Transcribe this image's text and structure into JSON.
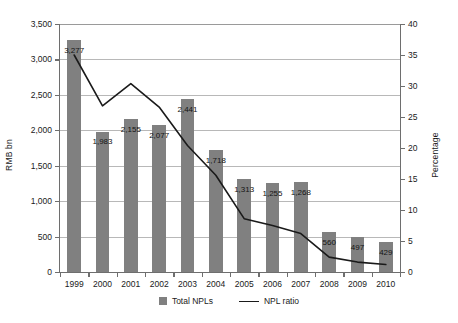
{
  "chart_data": {
    "type": "bar",
    "title": "",
    "subtitle": "",
    "xlabel": "",
    "ylabel": "RMB bn",
    "ylabel_secondary": "Percentage",
    "categories": [
      "1999",
      "2000",
      "2001",
      "2002",
      "2003",
      "2004",
      "2005",
      "2006",
      "2007",
      "2008",
      "2009",
      "2010"
    ],
    "ylim": [
      0,
      3500
    ],
    "ylim_secondary": [
      0,
      40
    ],
    "yticks": [
      "0",
      "500",
      "1,000",
      "1,500",
      "2,000",
      "2,500",
      "3,000",
      "3,500"
    ],
    "ytick_values": [
      0,
      500,
      1000,
      1500,
      2000,
      2500,
      3000,
      3500
    ],
    "yticks_secondary": [
      "0",
      "5",
      "10",
      "15",
      "20",
      "25",
      "30",
      "35",
      "40"
    ],
    "ytick_values_secondary": [
      0,
      5,
      10,
      15,
      20,
      25,
      30,
      35,
      40
    ],
    "grid": true,
    "grid_axis": "y",
    "legend_position": "bottom",
    "series": [
      {
        "name": "Total NPLs",
        "type": "bar",
        "axis": "left",
        "unit": "RMB bn",
        "color": "#808080",
        "values": [
          3277,
          1983,
          2155,
          2077,
          2441,
          1718,
          1313,
          1255,
          1268,
          560,
          497,
          429
        ],
        "labels": [
          "3,277",
          "1,983",
          "2,155",
          "2,077",
          "2,441",
          "1,718",
          "1,313",
          "1,255",
          "1,268",
          "560",
          "497",
          "429"
        ]
      },
      {
        "name": "NPL ratio",
        "type": "line",
        "axis": "right",
        "unit": "Percentage",
        "color": "#1a1a1a",
        "values": [
          35.0,
          26.8,
          30.4,
          26.6,
          20.4,
          15.6,
          8.6,
          7.5,
          6.2,
          2.4,
          1.6,
          1.2
        ]
      }
    ]
  },
  "legend": {
    "items": [
      {
        "label": "Total NPLs",
        "marker": "square-swatch"
      },
      {
        "label": "NPL ratio",
        "marker": "line-swatch"
      }
    ]
  }
}
